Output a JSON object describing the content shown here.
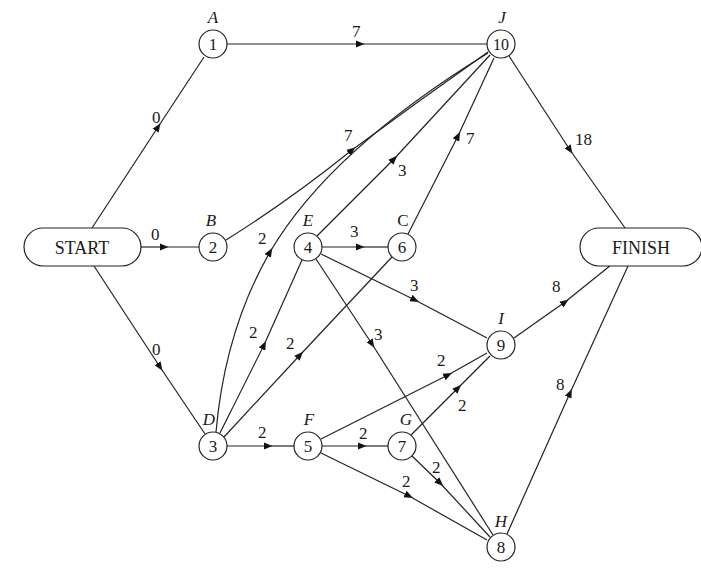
{
  "diagram": {
    "type": "activity-on-node network",
    "terminals": [
      {
        "id": "start",
        "label": "START",
        "x": 82,
        "y": 247,
        "w": 118,
        "h": 38
      },
      {
        "id": "finish",
        "label": "FINISH",
        "x": 657,
        "y": 247,
        "w": 124,
        "h": 38
      }
    ],
    "nodes": [
      {
        "id": "A",
        "number": "1",
        "letter": "A",
        "x": 213,
        "y": 44
      },
      {
        "id": "B",
        "number": "2",
        "letter": "B",
        "x": 213,
        "y": 247
      },
      {
        "id": "D",
        "number": "3",
        "letter": "D",
        "x": 213,
        "y": 446
      },
      {
        "id": "E",
        "number": "4",
        "letter": "E",
        "x": 308,
        "y": 247
      },
      {
        "id": "F",
        "number": "5",
        "letter": "F",
        "x": 308,
        "y": 446
      },
      {
        "id": "C",
        "number": "6",
        "letter": "C",
        "x": 402,
        "y": 247
      },
      {
        "id": "G",
        "number": "7",
        "letter": "G",
        "x": 402,
        "y": 446
      },
      {
        "id": "H",
        "number": "8",
        "letter": "H",
        "x": 501,
        "y": 547
      },
      {
        "id": "I",
        "number": "9",
        "letter": "I",
        "x": 501,
        "y": 345
      },
      {
        "id": "J",
        "number": "10",
        "letter": "J",
        "x": 501,
        "y": 44
      }
    ],
    "edges": [
      {
        "from": "START",
        "to": "A",
        "weight": "0"
      },
      {
        "from": "START",
        "to": "B",
        "weight": "0"
      },
      {
        "from": "START",
        "to": "D",
        "weight": "0"
      },
      {
        "from": "A",
        "to": "J",
        "weight": "7"
      },
      {
        "from": "B",
        "to": "J",
        "weight": "7"
      },
      {
        "from": "D",
        "to": "J",
        "weight": "2"
      },
      {
        "from": "E",
        "to": "J",
        "weight": "3"
      },
      {
        "from": "C",
        "to": "J",
        "weight": "7"
      },
      {
        "from": "D",
        "to": "E",
        "weight": "2"
      },
      {
        "from": "D",
        "to": "C",
        "weight": "2"
      },
      {
        "from": "E",
        "to": "C",
        "weight": "3"
      },
      {
        "from": "E",
        "to": "I",
        "weight": "3"
      },
      {
        "from": "E",
        "to": "H",
        "weight": "3"
      },
      {
        "from": "D",
        "to": "F",
        "weight": "2"
      },
      {
        "from": "F",
        "to": "G",
        "weight": "2"
      },
      {
        "from": "F",
        "to": "I",
        "weight": "2"
      },
      {
        "from": "F",
        "to": "H",
        "weight": "2"
      },
      {
        "from": "G",
        "to": "I",
        "weight": "2"
      },
      {
        "from": "G",
        "to": "H",
        "weight": "2"
      },
      {
        "from": "J",
        "to": "FINISH",
        "weight": "18"
      },
      {
        "from": "I",
        "to": "FINISH",
        "weight": "8"
      },
      {
        "from": "H",
        "to": "FINISH",
        "weight": "8"
      }
    ]
  },
  "labels": {
    "start": "START",
    "finish": "FINISH",
    "n1": "1",
    "n2": "2",
    "n3": "3",
    "n4": "4",
    "n5": "5",
    "n6": "6",
    "n7": "7",
    "n8": "8",
    "n9": "9",
    "n10": "10",
    "lA": "A",
    "lB": "B",
    "lC": "C",
    "lD": "D",
    "lE": "E",
    "lF": "F",
    "lG": "G",
    "lH": "H",
    "lI": "I",
    "lJ": "J",
    "w_start_A": "0",
    "w_start_B": "0",
    "w_start_D": "0",
    "w_A_J": "7",
    "w_B_J": "7",
    "w_D_J": "2",
    "w_E_J": "3",
    "w_C_J": "7",
    "w_D_E": "2",
    "w_D_C": "2",
    "w_E_C": "3",
    "w_E_I": "3",
    "w_E_H": "3",
    "w_D_F": "2",
    "w_F_G": "2",
    "w_F_I": "2",
    "w_F_H": "2",
    "w_G_I": "2",
    "w_G_H": "2",
    "w_J_fin": "18",
    "w_I_fin": "8",
    "w_H_fin": "8"
  }
}
